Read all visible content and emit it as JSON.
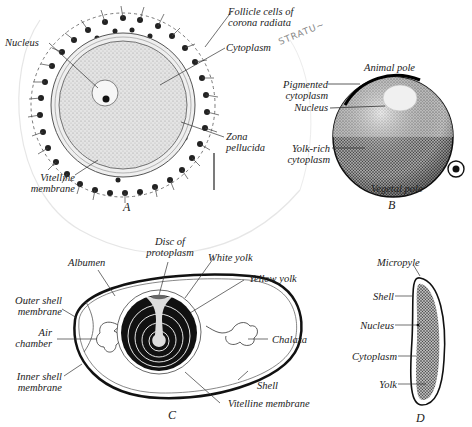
{
  "figures": {
    "A": {
      "letter": "A",
      "description": "Human ovum with follicle cells",
      "labels": {
        "follicle": [
          "Follicle cells of",
          "corona radiata"
        ],
        "nucleus": "Nucleus",
        "cytoplasm": "Cytoplasm",
        "zona": [
          "Zona",
          "pellucida"
        ],
        "vitelline": [
          "Vitelline",
          "membrane"
        ]
      }
    },
    "B": {
      "letter": "B",
      "description": "Amphibian egg",
      "labels": {
        "animal_pole": "Animal pole",
        "pigmented": [
          "Pigmented",
          "cytoplasm"
        ],
        "nucleus": "Nucleus",
        "yolk_rich": [
          "Yolk-rich",
          "cytoplasm"
        ],
        "vegetal_pole": "Vegetal pole"
      }
    },
    "C": {
      "letter": "C",
      "description": "Bird egg",
      "labels": {
        "disc": [
          "Disc of",
          "protoplasm"
        ],
        "albumen": "Albumen",
        "white_yolk": "White yolk",
        "yellow_yolk": "Yellow yolk",
        "outer_shell": [
          "Outer shell",
          "membrane"
        ],
        "air_chamber": [
          "Air",
          "chamber"
        ],
        "inner_shell": [
          "Inner shell",
          "membrane"
        ],
        "chalaza": "Chalaza",
        "shell": "Shell",
        "vitelline": "Vitelline membrane"
      }
    },
    "D": {
      "letter": "D",
      "description": "Insect egg",
      "labels": {
        "micropyle": "Micropyle",
        "shell": "Shell",
        "nucleus": "Nucleus",
        "cytoplasm": "Cytoplasm",
        "yolk": "Yolk"
      }
    }
  },
  "handwriting": "STRATU~",
  "colors": {
    "ink": "#1a1a1a",
    "paper": "#ffffff",
    "stipple": "#9a9a9a"
  }
}
